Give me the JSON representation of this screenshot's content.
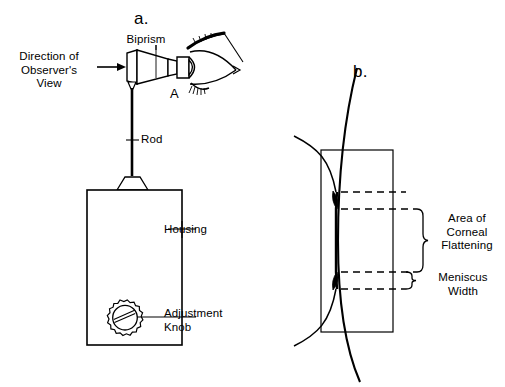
{
  "figure": {
    "background_color": "#ffffff",
    "line_color": "#000000"
  },
  "panels": {
    "a": {
      "letter": "a.",
      "labels": {
        "biprism": "Biprism",
        "direction_of_view": "Direction of\nObserver's\nView",
        "rod": "Rod",
        "housing": "Housing",
        "adjustment_knob": "Adjustment\nKnob",
        "contact_point": "A"
      }
    },
    "b": {
      "letter": "b.",
      "labels": {
        "area_of_corneal_flattening": "Area of\nCorneal\nFlattening",
        "meniscus_width": "Meniscus\nWidth"
      }
    }
  }
}
